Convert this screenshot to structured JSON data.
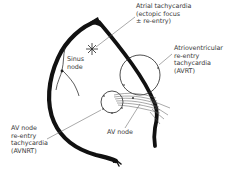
{
  "diagram": {
    "type": "cardiac conduction / tachycardia mechanisms",
    "labels": {
      "atrial_tachycardia": "Atrial tachycardia\n(ectopic focus\n± re-entry)",
      "avrt": "Atrioventricular\nre-entry\ntachycardia\n(AVRT)",
      "sinus_node": "Sinus\nnode",
      "avnrt": "AV node\nre-entry\ntachycardia\n(AVNRT)",
      "av_node": "AV node"
    },
    "structures": [
      {
        "name": "heart-outline",
        "description": "thick black atrial wall curve"
      },
      {
        "name": "septum",
        "description": "thick black diagonal line from apex to AV node"
      },
      {
        "name": "ectopic-focus",
        "description": "star-shaped burst symbol"
      },
      {
        "name": "avrt-circuit",
        "description": "large circle crossing the septum"
      },
      {
        "name": "avnrt-circuit",
        "description": "small circle near AV node"
      },
      {
        "name": "av-node",
        "description": "hatched region at septum base"
      }
    ],
    "colors": {
      "line": "#111111",
      "text": "#3a3a3a",
      "thin_line": "#444444"
    }
  }
}
